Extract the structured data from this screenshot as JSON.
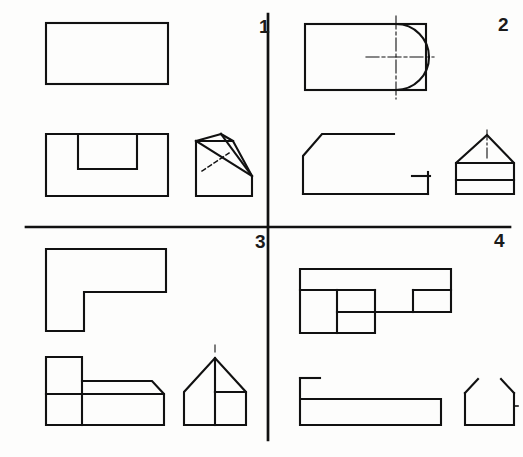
{
  "sheet": {
    "title": "Orthographic projection exercise sheet",
    "description": "Four numbered quadrants, each showing a top view, a front view and an isometric pictorial view of a machine part.",
    "background_color": "#fdfdfc",
    "line_color": "#111111",
    "divider_color": "#111111",
    "canvas": {
      "width": 523,
      "height": 457
    },
    "divider": {
      "vertical_x": 268,
      "horizontal_y": 227,
      "stroke_width": 2.6
    }
  },
  "quadrants": [
    {
      "number": "1",
      "label_position": {
        "x": 259,
        "y": 17
      },
      "views": [
        {
          "name": "top-view",
          "shape": "plain-rectangle",
          "description": "Plain rectangle, no internal detail"
        },
        {
          "name": "front-view",
          "shape": "rectangle-with-rectangular-notch",
          "description": "Rectangle with a rectangular notch opening from the top edge"
        },
        {
          "name": "isometric-view",
          "shape": "wedge-with-vee-notch",
          "description": "Pictorial of a wedge block with a vee notch, hidden edge shown dashed"
        }
      ]
    },
    {
      "number": "2",
      "label_position": {
        "x": 498,
        "y": 15
      },
      "views": [
        {
          "name": "top-view",
          "shape": "rectangle-with-semicircular-arc",
          "description": "Rectangle with a semicircular arc inside the right end, with horizontal and vertical centerlines crossing at the arc centre"
        },
        {
          "name": "front-view",
          "shape": "chamfered-open-profile",
          "description": "Open profile with a chamfered left corner and a short right-hand stub with a tick"
        },
        {
          "name": "isometric-view",
          "shape": "house-with-roof-and-two-bands",
          "description": "House outline: triangular roof with apex centerline over a body divided by two horizontal lines"
        }
      ]
    },
    {
      "number": "3",
      "label_position": {
        "x": 255,
        "y": 232
      },
      "views": [
        {
          "name": "top-view",
          "shape": "l-shaped-outline",
          "description": "L-shaped (angle) outline with the step on the lower-left"
        },
        {
          "name": "front-view",
          "shape": "stepped-block-with-chamfer",
          "description": "Stepped block with a raised left portion and a chamfered right corner"
        },
        {
          "name": "isometric-view",
          "shape": "house-with-gable-and-inset",
          "description": "House pictorial with apex centerline and an inset rectangular panel at the right"
        }
      ]
    },
    {
      "number": "4",
      "label_position": {
        "x": 494,
        "y": 231
      },
      "views": [
        {
          "name": "top-view",
          "shape": "staircase-outline",
          "description": "Staircase / zig-zag outline made of three descending steps"
        },
        {
          "name": "front-view",
          "shape": "open-channel-profile",
          "description": "Open channel profile: tall thin left wall over a long low rectangle"
        },
        {
          "name": "isometric-view",
          "shape": "trough-with-splayed-sides",
          "description": "Trough pictorial with two splayed side walls and an open top"
        }
      ]
    }
  ]
}
